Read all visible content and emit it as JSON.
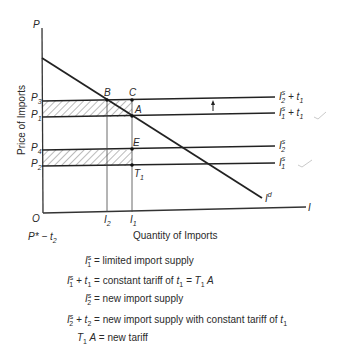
{
  "diagram": {
    "axes": {
      "y_label": "P",
      "x_label": "I",
      "origin_label": "O",
      "y_title": "Price of Imports",
      "x_title": "Quantity of Imports"
    },
    "price_levels": [
      {
        "label": "P",
        "sub": "3",
        "y": 101
      },
      {
        "label": "P",
        "sub": "1",
        "y": 117
      },
      {
        "label": "P",
        "sub": "4",
        "y": 150
      },
      {
        "label": "P",
        "sub": "2",
        "y": 166
      }
    ],
    "quantity_levels": [
      {
        "label": "I",
        "sub": "2",
        "x": 107
      },
      {
        "label": "I",
        "sub": "1",
        "x": 132
      }
    ],
    "points": [
      {
        "label": "B"
      },
      {
        "label": "C"
      },
      {
        "label": "A"
      },
      {
        "label": "E"
      },
      {
        "label": "T",
        "sub": "1"
      }
    ],
    "curves": [
      {
        "name": "I2s+t1",
        "label": "I",
        "sup": "s",
        "sub": "2",
        "suffix": " + t",
        "suffix_sub": "1"
      },
      {
        "name": "I1s+t1",
        "label": "I",
        "sup": "s",
        "sub": "1",
        "suffix": " + t",
        "suffix_sub": "1"
      },
      {
        "name": "I2s",
        "label": "I",
        "sup": "s",
        "sub": "2"
      },
      {
        "name": "I1s",
        "label": "I",
        "sup": "s",
        "sub": "1"
      },
      {
        "name": "Id",
        "label": "I",
        "sup": "d"
      }
    ],
    "note_below_origin": {
      "text": "P* − t",
      "sub": "2"
    },
    "arrow": "up-arrow"
  },
  "legend": [
    {
      "lhs": "I",
      "lhs_sup": "s",
      "lhs_sub": "1",
      "lhs_extra": "",
      "lhs_extra_sub": "",
      "text": " = limited import supply",
      "tail": "",
      "tail_sub": ""
    },
    {
      "lhs": "I",
      "lhs_sup": "s",
      "lhs_sub": "1",
      "lhs_extra": " + t",
      "lhs_extra_sub": "1",
      "text": " = constant tariff of ",
      "tail": "t",
      "tail_sub": "1",
      "tail2": " = T",
      "tail2_sub": "1",
      "tail3": " A"
    },
    {
      "lhs": "I",
      "lhs_sup": "s",
      "lhs_sub": "2",
      "lhs_extra": "",
      "lhs_extra_sub": "",
      "text": " = new import supply",
      "tail": "",
      "tail_sub": ""
    },
    {
      "lhs": "I",
      "lhs_sup": "s",
      "lhs_sub": "2",
      "lhs_extra": " + t",
      "lhs_extra_sub": "2",
      "text": " = new import supply with constant tariff of ",
      "tail": "t",
      "tail_sub": "1"
    },
    {
      "lhs": "T",
      "lhs_sup": "",
      "lhs_sub": "1",
      "lhs_extra": " A",
      "lhs_extra_sub": "",
      "text": " = new tariff",
      "tail": "",
      "tail_sub": ""
    }
  ]
}
